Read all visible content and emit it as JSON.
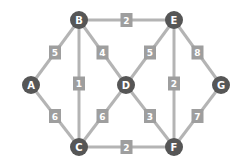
{
  "graph": {
    "nodes": [
      {
        "id": "A",
        "x": 31,
        "y": 85
      },
      {
        "id": "B",
        "x": 79,
        "y": 20
      },
      {
        "id": "E",
        "x": 174,
        "y": 20
      },
      {
        "id": "D",
        "x": 126,
        "y": 85
      },
      {
        "id": "G",
        "x": 221,
        "y": 85
      },
      {
        "id": "C",
        "x": 79,
        "y": 147
      },
      {
        "id": "F",
        "x": 174,
        "y": 147
      }
    ],
    "edges": [
      {
        "from": "A",
        "to": "B",
        "weight": "5"
      },
      {
        "from": "A",
        "to": "C",
        "weight": "6"
      },
      {
        "from": "B",
        "to": "E",
        "weight": "2"
      },
      {
        "from": "B",
        "to": "C",
        "weight": "1"
      },
      {
        "from": "B",
        "to": "D",
        "weight": "4"
      },
      {
        "from": "C",
        "to": "D",
        "weight": "6"
      },
      {
        "from": "C",
        "to": "F",
        "weight": "2"
      },
      {
        "from": "D",
        "to": "E",
        "weight": "5"
      },
      {
        "from": "D",
        "to": "F",
        "weight": "3"
      },
      {
        "from": "E",
        "to": "F",
        "weight": "2"
      },
      {
        "from": "E",
        "to": "G",
        "weight": "8"
      },
      {
        "from": "G",
        "to": "F",
        "weight": "7"
      }
    ],
    "colors": {
      "node": "#565656",
      "edge": "#b4b4b4",
      "label": "#9e9e9e"
    }
  }
}
